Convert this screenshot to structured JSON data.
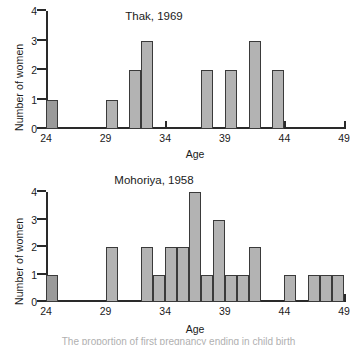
{
  "figure": {
    "caption": "The proportion of first pregnancy ending in child birth"
  },
  "axes": {
    "ylabel": "Number of women",
    "xlabel": "Age",
    "yticks": [
      "0",
      "1",
      "2",
      "3",
      "4"
    ],
    "xticks": [
      "24",
      "29",
      "34",
      "39",
      "44",
      "49"
    ]
  },
  "colors": {
    "bar_fill": "#b3b3b3",
    "bar_fill_dark": "#9a9a9a",
    "bar_stroke": "#3a3a3a",
    "axis": "#2a2a2a",
    "text": "#1a1a1a",
    "background": "#ffffff"
  },
  "chart_data": [
    {
      "type": "bar",
      "title": "Thak, 1969",
      "xlabel": "Age",
      "ylabel": "Number of women",
      "xlim": [
        24,
        49
      ],
      "ylim": [
        0,
        4
      ],
      "xticks": [
        24,
        29,
        34,
        39,
        44,
        49
      ],
      "yticks": [
        0,
        1,
        2,
        3,
        4
      ],
      "grid": false,
      "legend": null,
      "bin_width": 1,
      "categories": [
        24,
        29,
        31,
        32,
        37,
        39,
        41,
        43
      ],
      "values": [
        1,
        1,
        2,
        3,
        2,
        2,
        3,
        2
      ]
    },
    {
      "type": "bar",
      "title": "Mohoriya, 1958",
      "xlabel": "Age",
      "ylabel": "Number of women",
      "xlim": [
        24,
        49
      ],
      "ylim": [
        0,
        4
      ],
      "xticks": [
        24,
        29,
        34,
        39,
        44,
        49
      ],
      "yticks": [
        0,
        1,
        2,
        3,
        4
      ],
      "grid": false,
      "legend": null,
      "bin_width": 1,
      "categories": [
        24,
        29,
        32,
        33,
        34,
        35,
        36,
        37,
        38,
        39,
        40,
        41,
        44,
        46,
        47,
        48
      ],
      "values": [
        1,
        2,
        2,
        1,
        2,
        2,
        4,
        1,
        3,
        1,
        1,
        2,
        1,
        1,
        1,
        1
      ]
    }
  ]
}
